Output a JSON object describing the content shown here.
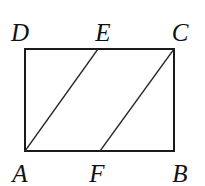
{
  "diagram": {
    "type": "geometry",
    "stroke_color": "#1a1a1a",
    "background": "#ffffff",
    "points": {
      "A": {
        "label": "A",
        "x": 25,
        "y": 151
      },
      "B": {
        "label": "B",
        "x": 174,
        "y": 151
      },
      "C": {
        "label": "C",
        "x": 174,
        "y": 49
      },
      "D": {
        "label": "D",
        "x": 25,
        "y": 49
      },
      "E": {
        "label": "E",
        "x": 98,
        "y": 49
      },
      "F": {
        "label": "F",
        "x": 100,
        "y": 151
      }
    },
    "segments": [
      {
        "from": "A",
        "to": "B"
      },
      {
        "from": "B",
        "to": "C"
      },
      {
        "from": "C",
        "to": "D"
      },
      {
        "from": "D",
        "to": "A"
      },
      {
        "from": "A",
        "to": "E"
      },
      {
        "from": "F",
        "to": "C"
      }
    ],
    "labels": {
      "A": "A",
      "B": "B",
      "C": "C",
      "D": "D",
      "E": "E",
      "F": "F"
    }
  }
}
